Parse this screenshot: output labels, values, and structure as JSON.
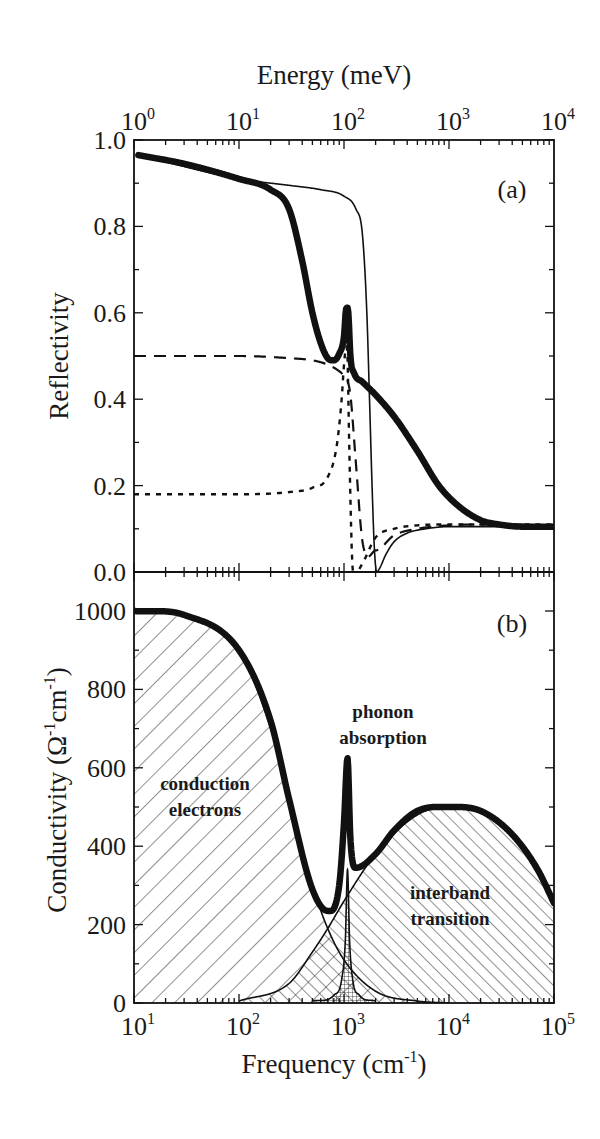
{
  "figure": {
    "top_axis_title": "Energy (meV)",
    "top_ticks": [
      {
        "base": "10",
        "exp": "0"
      },
      {
        "base": "10",
        "exp": "1"
      },
      {
        "base": "10",
        "exp": "2"
      },
      {
        "base": "10",
        "exp": "3"
      },
      {
        "base": "10",
        "exp": "4"
      }
    ],
    "bottom_ticks": [
      {
        "base": "10",
        "exp": "1"
      },
      {
        "base": "10",
        "exp": "2"
      },
      {
        "base": "10",
        "exp": "3"
      },
      {
        "base": "10",
        "exp": "4"
      },
      {
        "base": "10",
        "exp": "5"
      }
    ],
    "bottom_axis_title": {
      "main": "Frequency (cm",
      "sup": "-1",
      "close": ")"
    },
    "panel_a": {
      "label": "(a)",
      "ylabel": "Reflectivity",
      "yticks": [
        "0.0",
        "0.2",
        "0.4",
        "0.6",
        "0.8",
        "1.0"
      ]
    },
    "panel_b": {
      "label": "(b)",
      "ylabel": {
        "pre": "Conductivity (Ω",
        "sup1": "-1",
        "mid": "cm",
        "sup2": "-1",
        "close": ")"
      },
      "yticks": [
        "0",
        "200",
        "400",
        "600",
        "800",
        "1000"
      ],
      "annotations": {
        "conduction_1": "conduction",
        "conduction_2": "electrons",
        "phonon_1": "phonon",
        "phonon_2": "absorption",
        "interband_1": "interband",
        "interband_2": "transition"
      }
    }
  },
  "chart_data": [
    {
      "type": "line",
      "title": "(a)",
      "xlabel": "Frequency (cm^-1)",
      "x2label": "Energy (meV)",
      "ylabel": "Reflectivity",
      "xscale": "log",
      "xlim": [
        10,
        100000
      ],
      "x2lim": [
        1,
        10000
      ],
      "ylim": [
        0.0,
        1.0
      ],
      "grid": false,
      "series": [
        {
          "name": "total (thick solid)",
          "style": "thick-solid",
          "x": [
            11,
            30,
            100,
            200,
            300,
            400,
            500,
            600,
            700,
            800,
            900,
            1000,
            1050,
            1100,
            1150,
            1250,
            1500,
            2000,
            3000,
            5000,
            8000,
            12000,
            20000,
            30000,
            50000,
            100000
          ],
          "y": [
            0.965,
            0.945,
            0.91,
            0.885,
            0.84,
            0.72,
            0.6,
            0.53,
            0.495,
            0.49,
            0.505,
            0.545,
            0.61,
            0.6,
            0.5,
            0.46,
            0.44,
            0.41,
            0.36,
            0.28,
            0.2,
            0.155,
            0.12,
            0.11,
            0.105,
            0.105
          ]
        },
        {
          "name": "Drude only (thin solid)",
          "style": "thin-solid",
          "x": [
            11,
            100,
            300,
            600,
            1000,
            1300,
            1500,
            1650,
            1750,
            1850,
            1950,
            2050,
            2200,
            2500,
            3000,
            4000,
            6000,
            10000,
            20000,
            100000
          ],
          "y": [
            0.965,
            0.91,
            0.895,
            0.885,
            0.87,
            0.84,
            0.78,
            0.6,
            0.4,
            0.2,
            0.05,
            0.0,
            0.01,
            0.04,
            0.07,
            0.09,
            0.1,
            0.105,
            0.105,
            0.105
          ]
        },
        {
          "name": "interband only (long dash)",
          "style": "long-dash",
          "x": [
            10,
            100,
            300,
            500,
            700,
            900,
            1000,
            1050,
            1150,
            1300,
            1500,
            2000,
            3000,
            5000,
            10000,
            30000,
            100000
          ],
          "y": [
            0.5,
            0.5,
            0.495,
            0.49,
            0.48,
            0.465,
            0.455,
            0.45,
            0.41,
            0.25,
            0.07,
            0.05,
            0.085,
            0.1,
            0.108,
            0.11,
            0.108
          ]
        },
        {
          "name": "phonon only (short dash)",
          "style": "short-dash",
          "x": [
            10,
            100,
            300,
            500,
            700,
            850,
            950,
            1000,
            1050,
            1080,
            1120,
            1200,
            1300,
            1500,
            2000,
            3000,
            5000,
            10000,
            100000
          ],
          "y": [
            0.18,
            0.18,
            0.185,
            0.195,
            0.22,
            0.29,
            0.4,
            0.48,
            0.52,
            0.5,
            0.3,
            0.02,
            0.0,
            0.02,
            0.08,
            0.1,
            0.108,
            0.11,
            0.11
          ]
        }
      ]
    },
    {
      "type": "area",
      "title": "(b)",
      "xlabel": "Frequency (cm^-1)",
      "ylabel": "Conductivity (Ω^-1 cm^-1)",
      "xscale": "log",
      "xlim": [
        10,
        100000
      ],
      "ylim": [
        0,
        1000
      ],
      "grid": false,
      "series": [
        {
          "name": "total (thick solid)",
          "style": "thick-solid",
          "x": [
            10,
            30,
            100,
            200,
            300,
            500,
            700,
            900,
            1000,
            1080,
            1150,
            1300,
            2000,
            3000,
            5000,
            10000,
            20000,
            40000,
            70000,
            100000
          ],
          "y": [
            1000,
            990,
            900,
            720,
            520,
            290,
            235,
            300,
            460,
            625,
            420,
            345,
            380,
            440,
            490,
            500,
            490,
            430,
            340,
            255
          ]
        },
        {
          "name": "conduction electrons (Drude, hatched \\\\)",
          "style": "thin-solid-hatch-back",
          "x": [
            10,
            30,
            100,
            200,
            300,
            500,
            700,
            1000,
            2000,
            5000,
            10000
          ],
          "y": [
            1000,
            990,
            900,
            700,
            520,
            300,
            190,
            110,
            30,
            5,
            0
          ]
        },
        {
          "name": "phonon absorption (Lorentz, cross-hatched)",
          "style": "thin-solid-crosshatch",
          "x": [
            500,
            800,
            950,
            1030,
            1080,
            1130,
            1210,
            1400,
            2000
          ],
          "y": [
            5,
            20,
            60,
            160,
            340,
            160,
            60,
            20,
            5
          ]
        },
        {
          "name": "interband transition (Lorentz, hatched //)",
          "style": "thin-solid-hatch-fwd",
          "x": [
            100,
            300,
            500,
            700,
            1000,
            2000,
            5000,
            10000,
            40000,
            100000
          ],
          "y": [
            5,
            50,
            130,
            190,
            260,
            380,
            480,
            500,
            430,
            255
          ]
        }
      ],
      "annotations": [
        {
          "text": "conduction electrons",
          "x": 60,
          "y": 560
        },
        {
          "text": "phonon absorption",
          "x": 1000,
          "y": 730
        },
        {
          "text": "interband transition",
          "x": 8000,
          "y": 260
        }
      ]
    }
  ]
}
